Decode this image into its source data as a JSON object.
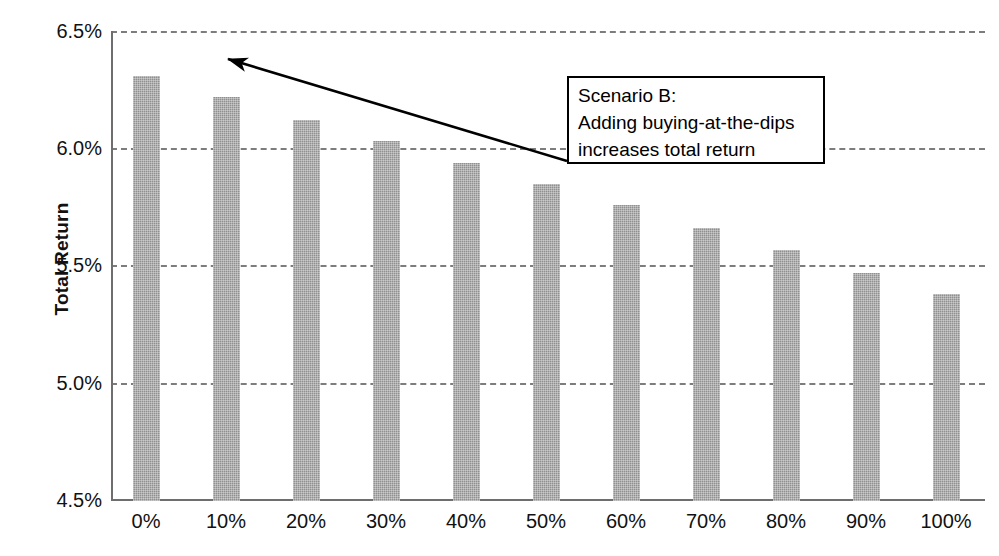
{
  "chart_data": {
    "type": "bar",
    "title": "",
    "xlabel": "",
    "ylabel": "Total Return",
    "categories": [
      "0%",
      "10%",
      "20%",
      "30%",
      "40%",
      "50%",
      "60%",
      "70%",
      "80%",
      "90%",
      "100%"
    ],
    "values": [
      6.31,
      6.22,
      6.12,
      6.03,
      5.94,
      5.85,
      5.76,
      5.66,
      5.57,
      5.47,
      5.38
    ],
    "ylim": [
      4.5,
      6.5
    ],
    "ytick_labels": [
      "6.5%",
      "6.0%",
      "5.5%",
      "5.0%",
      "4.5%"
    ],
    "ytick_values": [
      6.5,
      6.0,
      5.5,
      5.0,
      4.5
    ],
    "grid": true,
    "grid_style": "dashed",
    "legend": "none",
    "bar_color": "#909090",
    "annotations": [
      {
        "name": "scenario-b-callout",
        "lines": [
          "Scenario B:",
          "Adding buying-at-the-dips",
          "increases total return"
        ],
        "arrow_points_to": "0%"
      }
    ]
  },
  "axis": {
    "y_title": "Total Return"
  }
}
